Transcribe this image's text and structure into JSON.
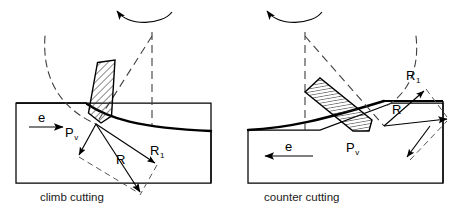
{
  "figure": {
    "type": "technical-diagram",
    "background": "#ffffff",
    "stroke_color": "#000000",
    "dashed_color": "#555555",
    "hatch_color": "#333333"
  },
  "panels": [
    {
      "id": "climb",
      "caption": "climb cutting",
      "feed": {
        "label": "e",
        "direction": "right",
        "arrow_glyph": "▶"
      },
      "rotation": {
        "direction": "counterclockwise",
        "arrow_glyph": "◀"
      },
      "labels": [
        {
          "name": "resultant-force-pv",
          "text": "P",
          "sub": "v"
        },
        {
          "name": "resultant-force-r",
          "text": "R",
          "sub": ""
        },
        {
          "name": "resultant-force-r1",
          "text": "R",
          "sub": "1"
        }
      ],
      "tool": {
        "name": "cutting-tool",
        "hatch": "diagonal",
        "tilt_deg": 12
      }
    },
    {
      "id": "counter",
      "caption": "counter cutting",
      "feed": {
        "label": "e",
        "direction": "left",
        "arrow_glyph": "◀"
      },
      "rotation": {
        "direction": "counterclockwise",
        "arrow_glyph": "◀"
      },
      "labels": [
        {
          "name": "resultant-force-pv",
          "text": "P",
          "sub": "v"
        },
        {
          "name": "resultant-force-r",
          "text": "R",
          "sub": ""
        },
        {
          "name": "resultant-force-r1",
          "text": "R",
          "sub": "1"
        }
      ],
      "tool": {
        "name": "cutting-tool",
        "hatch": "vertical",
        "tilt_deg": 35
      }
    }
  ],
  "text": {
    "climb_caption": "climb cutting",
    "counter_caption": "counter cutting",
    "feed_left": "e",
    "feed_right": "e",
    "pv_left": "P",
    "pv_left_sub": "v",
    "r_left": "R",
    "r1_left": "R",
    "r1_left_sub": "1",
    "pv_right": "P",
    "pv_right_sub": "v",
    "r_right": "R",
    "r1_right": "R",
    "r1_right_sub": "1"
  }
}
